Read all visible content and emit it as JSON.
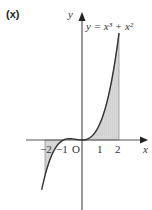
{
  "part_label": "(x)",
  "chart_data": {
    "type": "line",
    "title": "",
    "equation_label": "y = x³ + x²",
    "xlabel": "x",
    "ylabel": "y",
    "origin_label": "O",
    "x_ticks": [
      "-2",
      "-1",
      "1",
      "2"
    ],
    "x_tick_values": [
      -2,
      -1,
      1,
      2
    ],
    "xlim": [
      -2.3,
      3.5
    ],
    "ylim": [
      -7.5,
      14.5
    ],
    "function": "x^3 + x^2",
    "shaded_regions": [
      {
        "from": -2,
        "to": -1,
        "side": "below x-axis"
      },
      {
        "from": 0,
        "to": 2,
        "side": "above x-axis"
      }
    ],
    "grid": false,
    "legend": "none"
  },
  "axes": {
    "x_label": "x",
    "y_label": "y",
    "origin": "O",
    "ticks": {
      "m2": "−2",
      "m1": "−1",
      "p1": "1",
      "p2": "2"
    }
  }
}
